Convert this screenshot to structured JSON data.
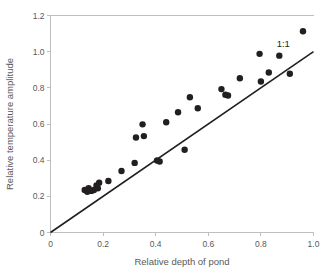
{
  "chart_data": {
    "type": "scatter",
    "title": "",
    "xlabel": "Relative depth of pond",
    "ylabel": "Relative temperature amplitude",
    "xlim": [
      0,
      1.0
    ],
    "ylim": [
      0,
      1.2
    ],
    "xticks": [
      "0",
      "0.2",
      "0.4",
      "0.6",
      "0.8",
      "1.0"
    ],
    "xtick_values": [
      0,
      0.2,
      0.4,
      0.6,
      0.8,
      1.0
    ],
    "yticks": [
      "0",
      "0.2",
      "0.4",
      "0.6",
      "0.8",
      "1.0",
      "1.2"
    ],
    "ytick_values": [
      0,
      0.2,
      0.4,
      0.6,
      0.8,
      1.0,
      1.2
    ],
    "grid": false,
    "legend": "none",
    "marker_color": "#231f20",
    "marker_shape": "circle",
    "axis_color": "#bcbec0",
    "background_color": "#ffffff",
    "series": [
      {
        "name": "Ponds",
        "points": [
          [
            0.13,
            0.235
          ],
          [
            0.14,
            0.225
          ],
          [
            0.145,
            0.245
          ],
          [
            0.155,
            0.23
          ],
          [
            0.165,
            0.235
          ],
          [
            0.175,
            0.26
          ],
          [
            0.18,
            0.245
          ],
          [
            0.185,
            0.275
          ],
          [
            0.22,
            0.285
          ],
          [
            0.27,
            0.34
          ],
          [
            0.32,
            0.385
          ],
          [
            0.325,
            0.525
          ],
          [
            0.35,
            0.598
          ],
          [
            0.355,
            0.533
          ],
          [
            0.405,
            0.398
          ],
          [
            0.415,
            0.393
          ],
          [
            0.44,
            0.61
          ],
          [
            0.485,
            0.665
          ],
          [
            0.51,
            0.458
          ],
          [
            0.53,
            0.748
          ],
          [
            0.56,
            0.687
          ],
          [
            0.65,
            0.793
          ],
          [
            0.665,
            0.762
          ],
          [
            0.675,
            0.758
          ],
          [
            0.72,
            0.853
          ],
          [
            0.795,
            0.988
          ],
          [
            0.8,
            0.835
          ],
          [
            0.83,
            0.885
          ],
          [
            0.87,
            0.978
          ],
          [
            0.91,
            0.878
          ],
          [
            0.96,
            1.113
          ]
        ]
      }
    ],
    "reference_line": {
      "label": "1:1",
      "slope": 1,
      "intercept": 0,
      "from": [
        0,
        0
      ],
      "to": [
        1.0,
        1.0
      ],
      "color": "#231f20"
    }
  }
}
